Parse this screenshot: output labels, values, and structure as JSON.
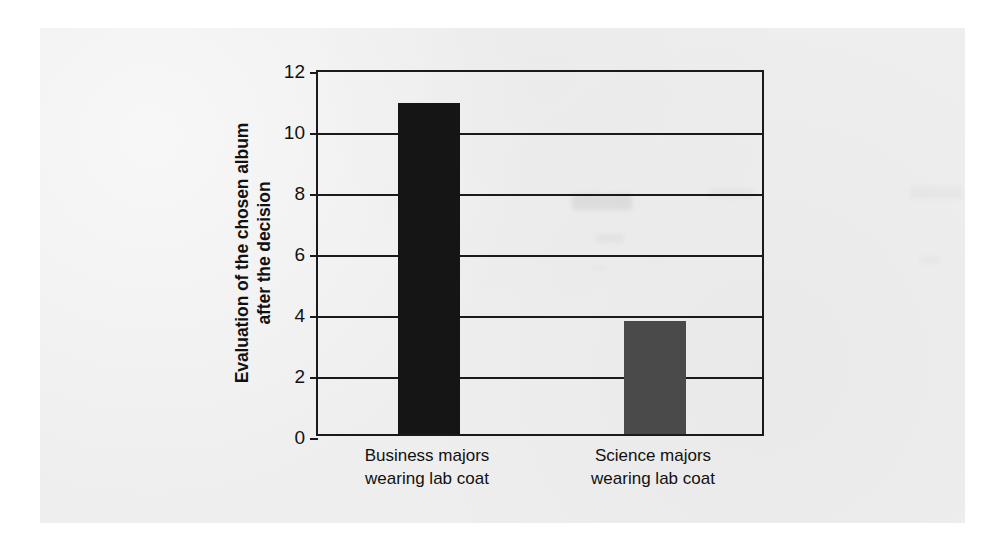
{
  "chart_data": {
    "type": "bar",
    "title": "",
    "subtitle": "",
    "xlabel": "",
    "ylabel": "Evaluation of the chosen album after the decision",
    "ylabel_lines": [
      "Evaluation of the chosen album",
      "after the decision"
    ],
    "categories": [
      "Business majors wearing lab coat",
      "Science majors wearing lab coat"
    ],
    "category_lines": [
      [
        "Business majors",
        "wearing lab coat"
      ],
      [
        "Science majors",
        "wearing lab coat"
      ]
    ],
    "values": [
      10.85,
      3.7
    ],
    "bar_colors": [
      "#151515",
      "#4a4a4a"
    ],
    "ylim": [
      0,
      12
    ],
    "ytick_labels": [
      "12",
      "10",
      "8",
      "6",
      "4",
      "2",
      "0"
    ],
    "ytick_values": [
      12,
      10,
      8,
      6,
      4,
      2,
      0
    ],
    "ytick_step": 2,
    "grid": true,
    "grid_axis": "y",
    "legend": false,
    "legend_position": "none",
    "axis_color": "#1a1a1a",
    "background_color": "#eeeeee"
  },
  "figure": {
    "page_background": "#eeeeee",
    "canvas_background": "#ffffff"
  }
}
